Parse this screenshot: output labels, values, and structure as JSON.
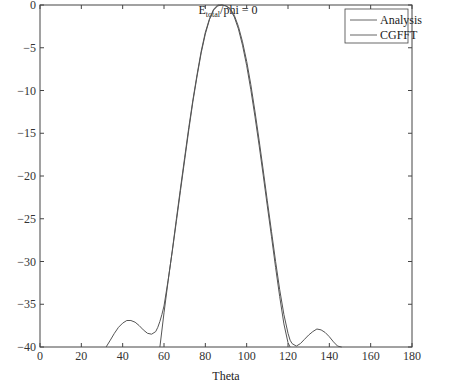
{
  "chart_data": {
    "type": "line",
    "title_main": "E",
    "title_sub": "total",
    "title_rest": "/phi = 0",
    "xlabel": "Theta",
    "ylabel": "",
    "xlim": [
      0,
      180
    ],
    "ylim": [
      -40,
      0
    ],
    "xticks": [
      0,
      20,
      40,
      60,
      80,
      100,
      120,
      140,
      160,
      180
    ],
    "yticks": [
      0,
      -5,
      -10,
      -15,
      -20,
      -25,
      -30,
      -35,
      -40
    ],
    "grid": false,
    "legend_position": "upper right",
    "series": [
      {
        "name": "Analysis",
        "color": "#555555",
        "x": [
          32,
          34,
          36,
          38,
          40,
          42,
          44,
          46,
          48,
          50,
          52,
          54,
          56,
          57,
          58,
          59,
          60,
          62,
          64,
          66,
          68,
          70,
          72,
          74,
          76,
          78,
          80,
          82,
          84,
          86,
          88,
          90,
          92,
          94,
          96,
          98,
          100,
          102,
          104,
          106,
          108,
          110,
          112,
          114,
          116,
          118,
          120,
          121,
          122,
          124,
          126,
          128,
          130,
          132,
          134,
          136,
          138,
          140,
          142,
          144,
          146
        ],
        "y": [
          -40,
          -39.2,
          -38.4,
          -37.7,
          -37.2,
          -36.9,
          -36.9,
          -37.1,
          -37.5,
          -38.0,
          -38.4,
          -38.5,
          -38.2,
          -37.7,
          -37.0,
          -36.2,
          -35.2,
          -32.2,
          -28.8,
          -25.3,
          -21.7,
          -18.1,
          -14.6,
          -11.3,
          -8.3,
          -5.6,
          -3.4,
          -1.7,
          -0.6,
          -0.1,
          0,
          -0.1,
          -0.4,
          -1.2,
          -2.5,
          -4.3,
          -6.6,
          -9.3,
          -12.4,
          -15.8,
          -19.3,
          -22.9,
          -26.5,
          -30.0,
          -33.3,
          -36.2,
          -38.4,
          -39.2,
          -39.6,
          -39.9,
          -39.6,
          -39.1,
          -38.6,
          -38.2,
          -37.9,
          -38.0,
          -38.3,
          -38.8,
          -39.4,
          -39.9,
          -40
        ]
      },
      {
        "name": "CGFFT",
        "color": "#555555",
        "x": [
          58,
          60,
          62,
          64,
          66,
          68,
          70,
          72,
          74,
          76,
          78,
          80,
          82,
          84,
          86,
          88,
          90,
          92,
          94,
          96,
          98,
          100,
          102,
          104,
          106,
          108,
          110,
          112,
          114,
          116,
          118,
          120,
          121
        ],
        "y": [
          -40,
          -36.0,
          -32.3,
          -28.7,
          -25.0,
          -21.4,
          -17.8,
          -14.3,
          -11.1,
          -8.1,
          -5.4,
          -3.2,
          -1.6,
          -0.5,
          0,
          0,
          -0.1,
          -0.5,
          -1.4,
          -2.8,
          -4.7,
          -7.1,
          -9.9,
          -13.0,
          -16.4,
          -19.9,
          -23.5,
          -27.1,
          -30.7,
          -34.1,
          -37.3,
          -39.5,
          -40
        ]
      }
    ]
  },
  "legend": {
    "items": [
      "Analysis",
      "CGFFT"
    ]
  }
}
